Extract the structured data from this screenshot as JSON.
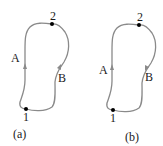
{
  "diagrams": [
    {
      "caption": "(a)",
      "point_start": "1",
      "point_end": "2",
      "path_left": "A",
      "path_right": "B",
      "path_left_direction": "up",
      "path_right_direction": "up"
    },
    {
      "caption": "(b)",
      "point_start": "1",
      "point_end": "2",
      "path_left": "A",
      "path_right": "B",
      "path_left_direction": "up",
      "path_right_direction": "down"
    }
  ],
  "colors": {
    "curve": "#8a8a8a",
    "point": "#000000",
    "text": "#1a1a1a"
  }
}
